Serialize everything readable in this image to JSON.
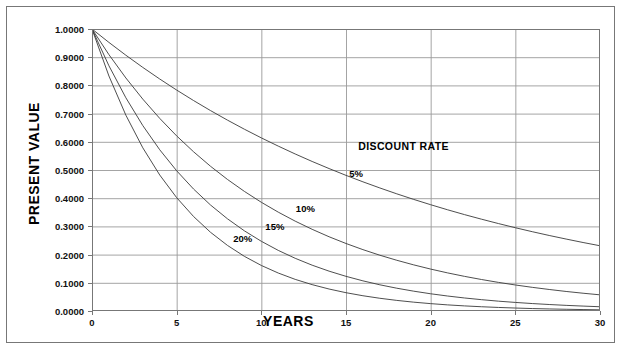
{
  "chart_data": {
    "type": "line",
    "title": "",
    "xlabel": "YEARS",
    "ylabel": "PRESENT VALUE",
    "xlim": [
      0,
      30
    ],
    "ylim": [
      0,
      1
    ],
    "grid": true,
    "legend_position": "inline-annotations",
    "legend_title": "DISCOUNT RATE",
    "x_tick_labels": [
      "0",
      "5",
      "10",
      "15",
      "20",
      "25",
      "30"
    ],
    "x_ticks": [
      0,
      5,
      10,
      15,
      20,
      25,
      30
    ],
    "y_tick_labels": [
      "0.0000",
      "0.1000",
      "0.2000",
      "0.3000",
      "0.4000",
      "0.5000",
      "0.6000",
      "0.7000",
      "0.8000",
      "0.9000",
      "1.0000"
    ],
    "y_ticks": [
      0,
      0.1,
      0.2,
      0.3,
      0.4,
      0.5,
      0.6,
      0.7,
      0.8,
      0.9,
      1.0
    ],
    "line_color": "#3a3a3a",
    "grid_color": "#9a9a9a",
    "axis_color": "#777777",
    "x": [
      0,
      1,
      2,
      3,
      4,
      5,
      6,
      7,
      8,
      9,
      10,
      11,
      12,
      13,
      14,
      15,
      16,
      17,
      18,
      19,
      20,
      21,
      22,
      23,
      24,
      25,
      26,
      27,
      28,
      29,
      30
    ],
    "series": [
      {
        "name": "5%",
        "rate": 0.05,
        "label": "5%",
        "label_x": 15.6,
        "label_y": 0.488,
        "values": [
          1.0,
          0.9524,
          0.907,
          0.8638,
          0.8227,
          0.7835,
          0.7462,
          0.7107,
          0.6768,
          0.6446,
          0.6139,
          0.5847,
          0.5568,
          0.5303,
          0.5051,
          0.481,
          0.4581,
          0.4363,
          0.4155,
          0.3957,
          0.3769,
          0.3589,
          0.3418,
          0.3256,
          0.3101,
          0.2953,
          0.2812,
          0.2678,
          0.2551,
          0.2429,
          0.2314
        ]
      },
      {
        "name": "10%",
        "rate": 0.1,
        "label": "10%",
        "label_x": 12.6,
        "label_y": 0.365,
        "values": [
          1.0,
          0.9091,
          0.8264,
          0.7513,
          0.683,
          0.6209,
          0.5645,
          0.5132,
          0.4665,
          0.4241,
          0.3855,
          0.3505,
          0.3186,
          0.2897,
          0.2633,
          0.2394,
          0.2176,
          0.1978,
          0.1799,
          0.1635,
          0.1486,
          0.1351,
          0.1228,
          0.1117,
          0.1015,
          0.0923,
          0.0839,
          0.0763,
          0.0693,
          0.063,
          0.0573
        ]
      },
      {
        "name": "15%",
        "rate": 0.15,
        "label": "15%",
        "label_x": 10.8,
        "label_y": 0.301,
        "values": [
          1.0,
          0.8696,
          0.7561,
          0.6575,
          0.5718,
          0.4972,
          0.4323,
          0.3759,
          0.3269,
          0.2843,
          0.2472,
          0.2149,
          0.1869,
          0.1625,
          0.1413,
          0.1229,
          0.1069,
          0.0929,
          0.0808,
          0.0703,
          0.0611,
          0.0531,
          0.0462,
          0.0402,
          0.0349,
          0.0304,
          0.0264,
          0.023,
          0.02,
          0.0174,
          0.0151
        ]
      },
      {
        "name": "20%",
        "rate": 0.2,
        "label": "20%",
        "label_x": 8.9,
        "label_y": 0.259,
        "values": [
          1.0,
          0.8333,
          0.6944,
          0.5787,
          0.4823,
          0.4019,
          0.3349,
          0.2791,
          0.2326,
          0.1938,
          0.1615,
          0.1346,
          0.1122,
          0.0935,
          0.0779,
          0.0649,
          0.0541,
          0.0451,
          0.0376,
          0.0313,
          0.0261,
          0.0217,
          0.0181,
          0.0151,
          0.0126,
          0.0105,
          0.0087,
          0.0073,
          0.0061,
          0.0051,
          0.0042
        ]
      }
    ],
    "legend_title_x": 18.4,
    "legend_title_y": 0.585
  }
}
